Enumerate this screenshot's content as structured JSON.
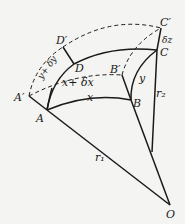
{
  "diagram": {
    "type": "geometric figure - curved surface element",
    "points": {
      "A_prime": "A′",
      "A": "A",
      "D_prime": "D′",
      "D": "D",
      "B_prime": "B′",
      "B": "B",
      "C_prime": "C′",
      "C": "C",
      "O": "O"
    },
    "edge_labels": {
      "x": "x",
      "x_plus_dx": "x+ δx",
      "y": "y",
      "y_plus_dy": "y+ δy",
      "dz": "δz",
      "r1": "r₁",
      "r2": "r₂"
    },
    "colors": {
      "ink": "#1a1a1a",
      "background": "#f4f4f2"
    }
  }
}
